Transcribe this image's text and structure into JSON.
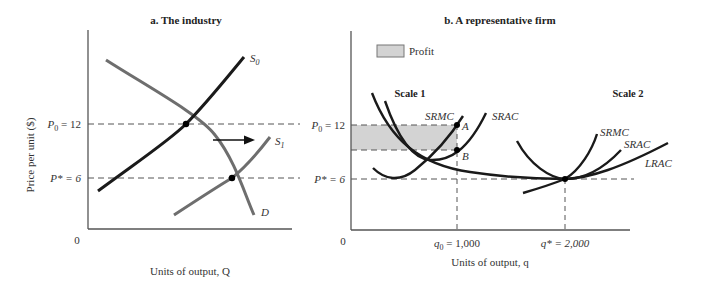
{
  "panel_a": {
    "title": "a. The industry",
    "ylabel": "Price per unit ($)",
    "xlabel": "Units of output, Q",
    "origin": "0",
    "p0_label": "P",
    "p0_sub": "0",
    "p0_val": " = 12",
    "pstar_label": "P* = 6",
    "s0_label": "S",
    "s0_sub": "0",
    "s1_label": "S",
    "s1_sub": "1",
    "d_label": "D"
  },
  "panel_b": {
    "title": "b. A representative firm",
    "legend_profit": "Profit",
    "scale1": "Scale 1",
    "scale2": "Scale 2",
    "srmc1": "SRMC",
    "srac1": "SRAC",
    "srmc2": "SRMC",
    "srac2": "SRAC",
    "lrac": "LRAC",
    "point_a": "A",
    "point_b": "B",
    "p0_label": "P",
    "p0_sub": "0",
    "p0_val": " = 12",
    "pstar_label": "P* = 6",
    "origin": "0",
    "q0_label": "q",
    "q0_sub": "0",
    "q0_val": " = 1,000",
    "qstar_label": "q* = 2,000",
    "xlabel": "Units of output, q"
  },
  "colors": {
    "axis": "#555555",
    "curve_dark": "#1a1a1a",
    "curve_gray": "#6e6e6e",
    "profit_fill": "#d3d3d3"
  }
}
